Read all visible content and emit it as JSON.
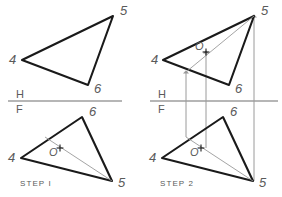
{
  "figure": {
    "background_color": "#ffffff",
    "line_color": "#1a1a1a",
    "thin_line_color": "#9a9a9a",
    "label_color": "#5a5a5a",
    "width": 282,
    "height": 197
  },
  "panels": [
    {
      "id": "step1",
      "step_label": "STEP I",
      "step_label_pos": {
        "x": 20,
        "y": 186
      },
      "fold_line": {
        "x1": 8,
        "y1": 101,
        "x2": 122,
        "y2": 101,
        "upper_label": "H",
        "lower_label": "F",
        "upper_label_pos": {
          "x": 16,
          "y": 98
        },
        "lower_label_pos": {
          "x": 16,
          "y": 113
        }
      },
      "top_view": {
        "name": "horizontal-view-triangle",
        "vertices": [
          {
            "name": "4",
            "x": 22,
            "y": 60,
            "label_pos": {
              "x": 9,
              "y": 64
            }
          },
          {
            "name": "5",
            "x": 113,
            "y": 16,
            "label_pos": {
              "x": 120,
              "y": 15
            }
          },
          {
            "name": "6",
            "x": 88,
            "y": 85,
            "label_pos": {
              "x": 94,
              "y": 93
            }
          }
        ],
        "point_o": null,
        "cutting_line": null
      },
      "front_view": {
        "name": "frontal-view-triangle",
        "vertices": [
          {
            "name": "4",
            "x": 21,
            "y": 158,
            "label_pos": {
              "x": 8,
              "y": 162
            }
          },
          {
            "name": "6",
            "x": 82,
            "y": 117,
            "label_pos": {
              "x": 89,
              "y": 116
            }
          },
          {
            "name": "5",
            "x": 112,
            "y": 181,
            "label_pos": {
              "x": 118,
              "y": 187
            }
          }
        ],
        "point_o": {
          "name": "point-o",
          "x": 60,
          "y": 148,
          "label": "O",
          "label_pos": {
            "x": 49,
            "y": 156
          }
        },
        "cutting_line": {
          "x1": 45,
          "y1": 137,
          "x2": 112,
          "y2": 181
        }
      },
      "projectors": []
    },
    {
      "id": "step2",
      "step_label": "STEP 2",
      "step_label_pos": {
        "x": 160,
        "y": 186
      },
      "fold_line": {
        "x1": 150,
        "y1": 101,
        "x2": 278,
        "y2": 101,
        "upper_label": "H",
        "lower_label": "F",
        "upper_label_pos": {
          "x": 158,
          "y": 98
        },
        "lower_label_pos": {
          "x": 158,
          "y": 113
        }
      },
      "top_view": {
        "name": "horizontal-view-triangle",
        "vertices": [
          {
            "name": "4",
            "x": 163,
            "y": 60,
            "label_pos": {
              "x": 151,
              "y": 64
            }
          },
          {
            "name": "5",
            "x": 254,
            "y": 16,
            "label_pos": {
              "x": 261,
              "y": 15
            }
          },
          {
            "name": "6",
            "x": 229,
            "y": 85,
            "label_pos": {
              "x": 235,
              "y": 93
            }
          }
        ],
        "point_o": {
          "name": "point-o",
          "x": 206,
          "y": 52,
          "label": "O",
          "label_pos": {
            "x": 195,
            "y": 50
          }
        },
        "cutting_line": {
          "x1": 186,
          "y1": 72,
          "x2": 254,
          "y2": 16
        }
      },
      "front_view": {
        "name": "frontal-view-triangle",
        "vertices": [
          {
            "name": "4",
            "x": 162,
            "y": 158,
            "label_pos": {
              "x": 149,
              "y": 162
            }
          },
          {
            "name": "6",
            "x": 223,
            "y": 117,
            "label_pos": {
              "x": 230,
              "y": 116
            }
          },
          {
            "name": "5",
            "x": 253,
            "y": 181,
            "label_pos": {
              "x": 259,
              "y": 187
            }
          }
        ],
        "point_o": {
          "name": "point-o",
          "x": 201,
          "y": 148,
          "label": "O",
          "label_pos": {
            "x": 190,
            "y": 156
          }
        },
        "cutting_line": {
          "x1": 186,
          "y1": 137,
          "x2": 253,
          "y2": 181
        }
      },
      "projectors": [
        {
          "name": "projector-left",
          "x": 186,
          "y_top": 72,
          "y_bottom": 137,
          "arrow": "up"
        },
        {
          "name": "projector-middle",
          "x": 206,
          "y_top": 52,
          "y_bottom": 148,
          "arrow": "up"
        },
        {
          "name": "projector-right",
          "x": 254,
          "y_top": 16,
          "y_bottom": 181,
          "arrow": "up"
        }
      ]
    }
  ]
}
